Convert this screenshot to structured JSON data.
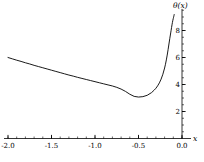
{
  "chart_data": {
    "type": "line",
    "title": "",
    "subtitle": "",
    "xlabel": "x",
    "ylabel": "θ(x)",
    "xlim": [
      -2.0,
      0.0
    ],
    "ylim": [
      0,
      9.6
    ],
    "grid": false,
    "legend": null,
    "background_color": "#ffffff",
    "line_color": "#000000",
    "axis_color": "#000000",
    "y_axis_position": "right",
    "x_axis_position": "bottom",
    "xticks": [
      -2.0,
      -1.5,
      -1.0,
      -0.5,
      0.0
    ],
    "xtick_labels": [
      "-2.0",
      "-1.5",
      "-1.0",
      "-0.5",
      "0.0"
    ],
    "yticks": [
      2,
      4,
      6,
      8
    ],
    "ytick_labels": [
      "2",
      "4",
      "6",
      "8"
    ],
    "x_minor_tick_step": 0.1,
    "y_minor_tick_step": 0.5,
    "annotations": [],
    "series": [
      {
        "name": "θ(x)",
        "x": [
          -2.0,
          -1.95,
          -1.9,
          -1.85,
          -1.8,
          -1.75,
          -1.7,
          -1.65,
          -1.6,
          -1.55,
          -1.5,
          -1.45,
          -1.4,
          -1.35,
          -1.3,
          -1.25,
          -1.2,
          -1.15,
          -1.1,
          -1.05,
          -1.0,
          -0.95,
          -0.9,
          -0.85,
          -0.8,
          -0.75,
          -0.7,
          -0.65,
          -0.6,
          -0.55,
          -0.5,
          -0.45,
          -0.4,
          -0.35,
          -0.32,
          -0.3,
          -0.28,
          -0.26,
          -0.24,
          -0.22,
          -0.2,
          -0.19,
          -0.18,
          -0.17,
          -0.16,
          -0.15,
          -0.14,
          -0.13,
          -0.125,
          -0.12,
          -0.115,
          -0.11,
          -0.105,
          -0.1,
          -0.097,
          -0.094,
          -0.092,
          -0.09
        ],
        "y": [
          6.0,
          5.9,
          5.8,
          5.71,
          5.61,
          5.52,
          5.42,
          5.33,
          5.24,
          5.15,
          5.06,
          4.97,
          4.88,
          4.79,
          4.7,
          4.62,
          4.53,
          4.45,
          4.37,
          4.29,
          4.21,
          4.13,
          4.05,
          3.97,
          3.89,
          3.79,
          3.66,
          3.49,
          3.28,
          3.12,
          3.07,
          3.1,
          3.2,
          3.4,
          3.58,
          3.72,
          3.9,
          4.12,
          4.4,
          4.76,
          5.22,
          5.5,
          5.82,
          6.18,
          6.58,
          7.0,
          7.42,
          7.82,
          8.02,
          8.22,
          8.42,
          8.6,
          8.76,
          8.9,
          8.98,
          9.06,
          9.12,
          9.18
        ]
      }
    ]
  },
  "axis_labels": {
    "y_name": "θ(x)",
    "x_name": "x"
  }
}
